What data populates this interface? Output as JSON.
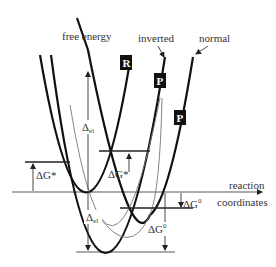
{
  "diagram": {
    "type": "marcus-theory-energy-parabolas",
    "labels": {
      "free_energy": "free energy",
      "inverted": "inverted",
      "normal": "normal",
      "axis_line1": "reaction",
      "axis_line2": "coordinates",
      "reactant_box": "R",
      "product_box_inverted": "P",
      "product_box_normal": "P",
      "lambda_upper": "Δ",
      "lambda_upper_sub": "el",
      "lambda_lower": "Δ",
      "lambda_lower_sub": "el",
      "activation_left": "ΔG*",
      "activation_mid": "ΔG*",
      "dg0_small": "ΔG",
      "dg0_small_sup": "0",
      "dg0_large": "ΔG",
      "dg0_large_sup": "0"
    },
    "colors": {
      "curve": "#111111",
      "thin_curve": "#777777",
      "label_box": "#111111",
      "text": "#333333"
    }
  }
}
